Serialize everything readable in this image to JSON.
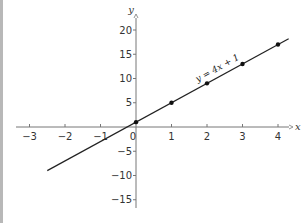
{
  "chart_data": {
    "type": "line",
    "title": "",
    "xlabel": "x",
    "ylabel": "y",
    "xlim": [
      -3.3,
      4.4
    ],
    "ylim": [
      -17,
      21
    ],
    "grid": false,
    "x_ticks": [
      -3,
      -2,
      -1,
      0,
      1,
      2,
      3,
      4
    ],
    "y_ticks": [
      -15,
      -10,
      -5,
      5,
      10,
      15,
      20
    ],
    "x_tick_labels": [
      "−3",
      "−2",
      "−1",
      "0",
      "1",
      "2",
      "3",
      "4"
    ],
    "y_tick_labels": [
      "−15",
      "−10",
      "−5",
      "5",
      "10",
      "15",
      "20"
    ],
    "series": [
      {
        "name": "y = 4x + 1",
        "line_x_range": [
          -2.5,
          4.3
        ],
        "points_x": [
          0,
          1,
          2,
          3,
          4
        ],
        "points_y": [
          1,
          5,
          9,
          13,
          17
        ]
      }
    ],
    "annotations": [
      {
        "text": "y = 4x + 1",
        "at_x": 2.5,
        "at_y": 11
      }
    ]
  }
}
